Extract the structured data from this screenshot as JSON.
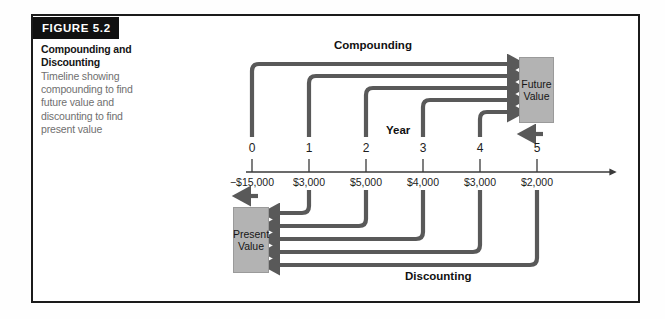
{
  "figure": {
    "banner_label": "FIGURE 5.2",
    "title": "Compounding and Discounting",
    "description": "Timeline showing compounding to find future value and discounting to find present value"
  },
  "diagram": {
    "compounding_label": "Compounding",
    "discounting_label": "Discounting",
    "year_axis_label": "Year",
    "future_value_line1": "Future",
    "future_value_line2": "Value",
    "present_value_line1": "Present",
    "present_value_line2": "Value",
    "years": [
      "0",
      "1",
      "2",
      "3",
      "4",
      "5"
    ],
    "cash_flows": [
      "−$15,000",
      "$3,000",
      "$5,000",
      "$4,000",
      "$3,000",
      "$2,000"
    ],
    "colors": {
      "arrow": "#595959",
      "box_fill": "#b3b3b3",
      "frame": "#1b1b1b",
      "banner": "#111111",
      "caption_text": "#6f6f6f",
      "axis": "#3a3a3a"
    }
  }
}
